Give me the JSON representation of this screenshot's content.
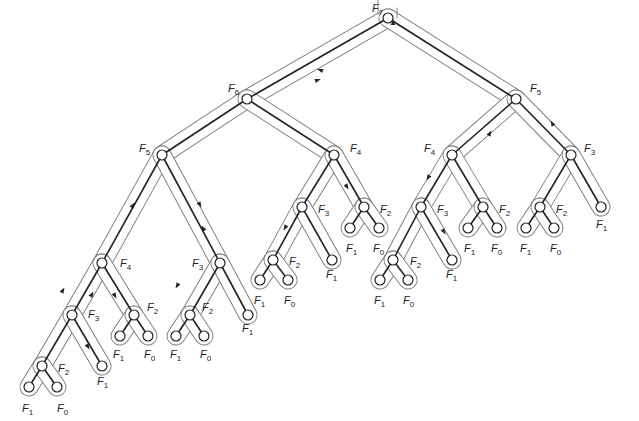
{
  "colors": {
    "edge": "#222222",
    "contour": "#777777",
    "node_fill": "#ffffff",
    "background": "#ffffff"
  },
  "nodes": [
    {
      "id": "n0",
      "label": "F",
      "sub": "7",
      "x": 388,
      "y": 18,
      "lx": 372,
      "ly": 12
    },
    {
      "id": "n1",
      "label": "F",
      "sub": "6",
      "x": 247,
      "y": 99,
      "lx": 228,
      "ly": 92,
      "parent": "n0"
    },
    {
      "id": "n2",
      "label": "F",
      "sub": "5",
      "x": 516,
      "y": 99,
      "lx": 530,
      "ly": 92,
      "parent": "n0"
    },
    {
      "id": "n3",
      "label": "F",
      "sub": "5",
      "x": 162,
      "y": 155,
      "lx": 139,
      "ly": 152,
      "parent": "n1"
    },
    {
      "id": "n4",
      "label": "F",
      "sub": "4",
      "x": 334,
      "y": 155,
      "lx": 350,
      "ly": 152,
      "parent": "n1"
    },
    {
      "id": "n5",
      "label": "F",
      "sub": "4",
      "x": 102,
      "y": 263,
      "lx": 120,
      "ly": 267,
      "parent": "n3"
    },
    {
      "id": "n6",
      "label": "F",
      "sub": "3",
      "x": 220,
      "y": 263,
      "lx": 192,
      "ly": 267,
      "parent": "n3"
    },
    {
      "id": "n7",
      "label": "F",
      "sub": "3",
      "x": 72,
      "y": 315,
      "lx": 88,
      "ly": 318,
      "parent": "n5"
    },
    {
      "id": "n8",
      "label": "F",
      "sub": "2",
      "x": 134,
      "y": 315,
      "lx": 147,
      "ly": 311,
      "parent": "n5"
    },
    {
      "id": "n9",
      "label": "F",
      "sub": "2",
      "x": 42,
      "y": 366,
      "lx": 58,
      "ly": 372,
      "parent": "n7"
    },
    {
      "id": "n10",
      "label": "F",
      "sub": "1",
      "x": 102,
      "y": 366,
      "lx": 97,
      "ly": 385,
      "parent": "n7"
    },
    {
      "id": "n11",
      "label": "F",
      "sub": "1",
      "x": 29,
      "y": 387,
      "lx": 22,
      "ly": 412,
      "parent": "n9"
    },
    {
      "id": "n12",
      "label": "F",
      "sub": "0",
      "x": 57,
      "y": 387,
      "lx": 57,
      "ly": 412,
      "parent": "n9"
    },
    {
      "id": "n13",
      "label": "F",
      "sub": "1",
      "x": 120,
      "y": 336,
      "lx": 113,
      "ly": 358,
      "parent": "n8"
    },
    {
      "id": "n14",
      "label": "F",
      "sub": "0",
      "x": 148,
      "y": 336,
      "lx": 144,
      "ly": 358,
      "parent": "n8"
    },
    {
      "id": "n15",
      "label": "F",
      "sub": "2",
      "x": 190,
      "y": 315,
      "lx": 202,
      "ly": 311,
      "parent": "n6"
    },
    {
      "id": "n16",
      "label": "F",
      "sub": "1",
      "x": 248,
      "y": 315,
      "lx": 242,
      "ly": 332,
      "parent": "n6"
    },
    {
      "id": "n17",
      "label": "F",
      "sub": "1",
      "x": 176,
      "y": 336,
      "lx": 170,
      "ly": 358,
      "parent": "n15"
    },
    {
      "id": "n18",
      "label": "F",
      "sub": "0",
      "x": 204,
      "y": 336,
      "lx": 200,
      "ly": 358,
      "parent": "n15"
    },
    {
      "id": "n19",
      "label": "F",
      "sub": "3",
      "x": 302,
      "y": 207,
      "lx": 318,
      "ly": 213,
      "parent": "n4"
    },
    {
      "id": "n20",
      "label": "F",
      "sub": "2",
      "x": 364,
      "y": 207,
      "lx": 380,
      "ly": 213,
      "parent": "n4"
    },
    {
      "id": "n21",
      "label": "F",
      "sub": "2",
      "x": 273,
      "y": 260,
      "lx": 289,
      "ly": 265,
      "parent": "n19"
    },
    {
      "id": "n22",
      "label": "F",
      "sub": "1",
      "x": 332,
      "y": 260,
      "lx": 326,
      "ly": 278,
      "parent": "n19"
    },
    {
      "id": "n23",
      "label": "F",
      "sub": "1",
      "x": 260,
      "y": 280,
      "lx": 254,
      "ly": 304,
      "parent": "n21"
    },
    {
      "id": "n24",
      "label": "F",
      "sub": "0",
      "x": 288,
      "y": 280,
      "lx": 284,
      "ly": 304,
      "parent": "n21"
    },
    {
      "id": "n25",
      "label": "F",
      "sub": "1",
      "x": 350,
      "y": 228,
      "lx": 346,
      "ly": 252,
      "parent": "n20"
    },
    {
      "id": "n26",
      "label": "F",
      "sub": "0",
      "x": 379,
      "y": 228,
      "lx": 373,
      "ly": 252,
      "parent": "n20"
    },
    {
      "id": "n27",
      "label": "F",
      "sub": "4",
      "x": 452,
      "y": 155,
      "lx": 424,
      "ly": 152,
      "parent": "n2"
    },
    {
      "id": "n28",
      "label": "F",
      "sub": "3",
      "x": 571,
      "y": 155,
      "lx": 584,
      "ly": 152,
      "parent": "n2"
    },
    {
      "id": "n29",
      "label": "F",
      "sub": "3",
      "x": 421,
      "y": 207,
      "lx": 437,
      "ly": 213,
      "parent": "n27"
    },
    {
      "id": "n30",
      "label": "F",
      "sub": "2",
      "x": 483,
      "y": 207,
      "lx": 499,
      "ly": 213,
      "parent": "n27"
    },
    {
      "id": "n31",
      "label": "F",
      "sub": "2",
      "x": 393,
      "y": 260,
      "lx": 410,
      "ly": 265,
      "parent": "n29"
    },
    {
      "id": "n32",
      "label": "F",
      "sub": "1",
      "x": 452,
      "y": 260,
      "lx": 446,
      "ly": 278,
      "parent": "n29"
    },
    {
      "id": "n33",
      "label": "F",
      "sub": "1",
      "x": 380,
      "y": 280,
      "lx": 374,
      "ly": 304,
      "parent": "n31"
    },
    {
      "id": "n34",
      "label": "F",
      "sub": "0",
      "x": 408,
      "y": 280,
      "lx": 403,
      "ly": 304,
      "parent": "n31"
    },
    {
      "id": "n35",
      "label": "F",
      "sub": "1",
      "x": 468,
      "y": 228,
      "lx": 464,
      "ly": 252,
      "parent": "n30"
    },
    {
      "id": "n36",
      "label": "F",
      "sub": "0",
      "x": 497,
      "y": 228,
      "lx": 491,
      "ly": 252,
      "parent": "n30"
    },
    {
      "id": "n37",
      "label": "F",
      "sub": "2",
      "x": 540,
      "y": 207,
      "lx": 556,
      "ly": 213,
      "parent": "n28"
    },
    {
      "id": "n38",
      "label": "F",
      "sub": "1",
      "x": 601,
      "y": 207,
      "lx": 596,
      "ly": 228,
      "parent": "n28"
    },
    {
      "id": "n39",
      "label": "F",
      "sub": "1",
      "x": 526,
      "y": 228,
      "lx": 520,
      "ly": 252,
      "parent": "n37"
    },
    {
      "id": "n40",
      "label": "F",
      "sub": "0",
      "x": 554,
      "y": 228,
      "lx": 550,
      "ly": 252,
      "parent": "n37"
    }
  ],
  "arrows": [
    {
      "x": 393,
      "y": 22,
      "angle": -90
    },
    {
      "x": 320,
      "y": 70,
      "angle": 200
    },
    {
      "x": 318,
      "y": 80,
      "angle": -20
    },
    {
      "x": 133,
      "y": 205,
      "angle": -60
    },
    {
      "x": 200,
      "y": 205,
      "angle": 60
    },
    {
      "x": 63,
      "y": 290,
      "angle": -60
    },
    {
      "x": 88,
      "y": 347,
      "angle": 60
    },
    {
      "x": 92,
      "y": 294,
      "angle": -60
    },
    {
      "x": 115,
      "y": 296,
      "angle": 60
    },
    {
      "x": 177,
      "y": 286,
      "angle": 120
    },
    {
      "x": 203,
      "y": 228,
      "angle": -120
    },
    {
      "x": 285,
      "y": 228,
      "angle": 120
    },
    {
      "x": 347,
      "y": 187,
      "angle": 60
    },
    {
      "x": 428,
      "y": 178,
      "angle": 120
    },
    {
      "x": 490,
      "y": 133,
      "angle": -60
    },
    {
      "x": 552,
      "y": 123,
      "angle": -120
    },
    {
      "x": 444,
      "y": 232,
      "angle": 60
    }
  ]
}
